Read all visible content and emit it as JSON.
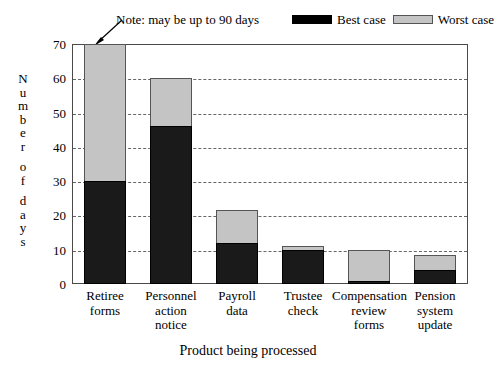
{
  "chart_data": {
    "type": "bar",
    "subtype": "stacked-bar",
    "title": "",
    "xlabel": "Product being processed",
    "ylabel": "Number of days",
    "ylim": [
      0,
      70
    ],
    "ytick_values": [
      0,
      10,
      20,
      30,
      40,
      50,
      60,
      70
    ],
    "ytick_labels": [
      "0",
      "10",
      "20",
      "30",
      "40",
      "50",
      "60",
      "70"
    ],
    "grid": true,
    "grid_style": "dashed",
    "legend_position": "top-right",
    "categories": [
      "Retiree forms",
      "Personnel action notice",
      "Payroll data",
      "Trustee check",
      "Compensation review forms",
      "Pension system update"
    ],
    "category_lines": [
      [
        "Retiree",
        "forms"
      ],
      [
        "Personnel",
        "action",
        "notice"
      ],
      [
        "Payroll",
        "data"
      ],
      [
        "Trustee",
        "check"
      ],
      [
        "Compensation",
        "review",
        "forms"
      ],
      [
        "Pension",
        "system",
        "update"
      ]
    ],
    "series": [
      {
        "name": "Best case",
        "color": "#1a1a1a",
        "values": [
          30,
          46,
          12,
          10,
          1,
          4
        ]
      },
      {
        "name": "Worst case",
        "color": "#c4c4c4",
        "values": [
          70,
          60,
          21.5,
          11,
          10,
          8.5
        ],
        "note": "worst case values are cumulative bar tops"
      }
    ],
    "annotations": [
      {
        "text": "Note: may be up to 90 days",
        "points_to": "Retiree forms worst case bar top"
      }
    ]
  },
  "legend": {
    "entries": [
      {
        "label": "Best case",
        "swatch": "black-swatch"
      },
      {
        "label": "Worst case",
        "swatch": "gray-swatch"
      }
    ]
  },
  "note": {
    "text": "Note: may be up to 90 days"
  },
  "axes": {
    "y_label_letters": [
      "N",
      "u",
      "m",
      "b",
      "e",
      "r",
      "",
      "o",
      "f",
      "",
      "d",
      "a",
      "y",
      "s"
    ],
    "x_title": "Product being processed"
  }
}
